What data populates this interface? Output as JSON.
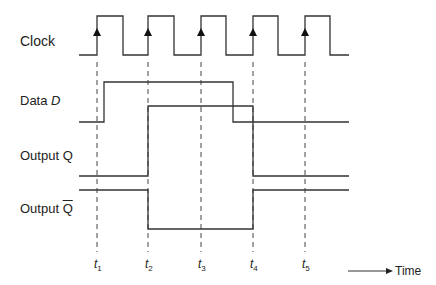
{
  "signals": [
    {
      "name": "clock",
      "label": "Clock",
      "label_x": 20,
      "label_y": 35
    },
    {
      "name": "data",
      "label_prefix": "Data ",
      "label_var": "D",
      "label_x": 20,
      "label_y": 93
    },
    {
      "name": "q",
      "label": "Output Q",
      "label_x": 20,
      "label_y": 147
    },
    {
      "name": "qbar",
      "label_prefix": "Output ",
      "label_var": "Q",
      "label_x": 20,
      "label_y": 201
    }
  ],
  "time_markers": [
    {
      "label": "t",
      "sub": "1",
      "x": 97
    },
    {
      "label": "t",
      "sub": "2",
      "x": 148
    },
    {
      "label": "t",
      "sub": "3",
      "x": 201
    },
    {
      "label": "t",
      "sub": "4",
      "x": 253
    },
    {
      "label": "t",
      "sub": "5",
      "x": 305
    }
  ],
  "axis": {
    "label": "Time"
  },
  "waveforms": {
    "clock": "79,55 97,55 97,16 123,16 123,55 148,55 148,16 174,16 174,55 201,55 201,16 226,16 226,55 253,55 253,16 278,16 278,55 305,55 305,16 330,16 330,55 349,55",
    "data": "79,122 104,122 104,82 233,82 233,122 349,122",
    "q": "79,176 148,176 148,106 253,106 253,176 349,176",
    "qbar": "79,190 148,190 148,229 253,229 253,190 349,190"
  },
  "colors": {
    "line": "#333333",
    "dash": "#444444"
  }
}
